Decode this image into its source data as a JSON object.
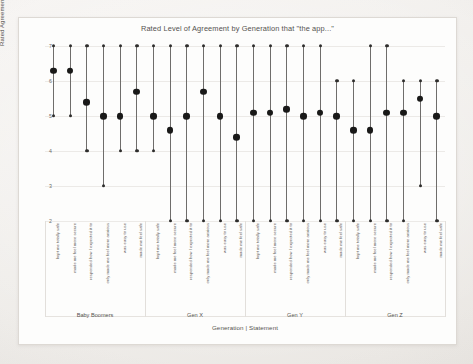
{
  "chart_data": {
    "type": "scatter",
    "title": "Rated Level of Agreement by Generation that \"the app...\"",
    "xlabel": "Generation | Statement",
    "ylabel": "Rated Agreement Level",
    "ylim": [
      2,
      7
    ],
    "yticks": [
      7,
      6,
      5,
      4,
      3,
      2
    ],
    "grid": true,
    "legend": "none",
    "marker_style": "range line with mean dot and end caps",
    "groups": [
      "Baby Boomers",
      "Gen X",
      "Gen Y",
      "Gen Z"
    ],
    "statements": [
      "kept me totally safe",
      "made me feel more secure",
      "responded how I expected it to",
      "only made me feel more anxious",
      "was easy to use",
      "made me feel safe"
    ],
    "series": [
      {
        "name": "Baby Boomers",
        "points": [
          {
            "statement": "kept me totally safe",
            "mean": 6.3,
            "low": 5.0,
            "high": 7.0
          },
          {
            "statement": "made me feel more secure",
            "mean": 6.3,
            "low": 5.0,
            "high": 7.0
          },
          {
            "statement": "responded how I expected it to",
            "mean": 5.4,
            "low": 4.0,
            "high": 7.0
          },
          {
            "statement": "only made me feel more anxious",
            "mean": 5.0,
            "low": 3.0,
            "high": 7.0
          },
          {
            "statement": "was easy to use",
            "mean": 5.0,
            "low": 4.0,
            "high": 7.0
          },
          {
            "statement": "made me feel safe",
            "mean": 5.7,
            "low": 4.0,
            "high": 7.0
          }
        ]
      },
      {
        "name": "Gen X",
        "points": [
          {
            "statement": "kept me totally safe",
            "mean": 5.0,
            "low": 4.0,
            "high": 7.0
          },
          {
            "statement": "made me feel more secure",
            "mean": 4.6,
            "low": 2.0,
            "high": 7.0
          },
          {
            "statement": "responded how I expected it to",
            "mean": 5.0,
            "low": 2.0,
            "high": 7.0
          },
          {
            "statement": "only made me feel more anxious",
            "mean": 5.7,
            "low": 2.0,
            "high": 7.0
          },
          {
            "statement": "was easy to use",
            "mean": 5.0,
            "low": 2.0,
            "high": 7.0
          },
          {
            "statement": "made me feel safe",
            "mean": 4.4,
            "low": 2.0,
            "high": 7.0
          }
        ]
      },
      {
        "name": "Gen Y",
        "points": [
          {
            "statement": "kept me totally safe",
            "mean": 5.1,
            "low": 2.0,
            "high": 7.0
          },
          {
            "statement": "made me feel more secure",
            "mean": 5.1,
            "low": 2.0,
            "high": 7.0
          },
          {
            "statement": "responded how I expected it to",
            "mean": 5.2,
            "low": 2.0,
            "high": 7.0
          },
          {
            "statement": "only made me feel more anxious",
            "mean": 5.0,
            "low": 2.0,
            "high": 7.0
          },
          {
            "statement": "was easy to use",
            "mean": 5.1,
            "low": 2.0,
            "high": 7.0
          },
          {
            "statement": "made me feel safe",
            "mean": 5.0,
            "low": 2.0,
            "high": 6.0
          }
        ]
      },
      {
        "name": "Gen Z",
        "points": [
          {
            "statement": "kept me totally safe",
            "mean": 4.6,
            "low": 2.0,
            "high": 6.0
          },
          {
            "statement": "made me feel more secure",
            "mean": 4.6,
            "low": 2.0,
            "high": 7.0
          },
          {
            "statement": "responded how I expected it to",
            "mean": 5.1,
            "low": 2.0,
            "high": 7.0
          },
          {
            "statement": "only made me feel more anxious",
            "mean": 5.1,
            "low": 2.0,
            "high": 6.0
          },
          {
            "statement": "was easy to use",
            "mean": 5.5,
            "low": 3.0,
            "high": 6.0
          },
          {
            "statement": "made me feel safe",
            "mean": 5.0,
            "low": 2.0,
            "high": 6.0
          }
        ]
      }
    ],
    "colors": {
      "mean_marker": "#191918",
      "cap_marker": "#2e2d2c",
      "stem": "#6f6d6b",
      "grid": "#eceae7",
      "panel": "#fdfdfc",
      "page": "#f4f2f0",
      "text": "#55534f"
    }
  }
}
